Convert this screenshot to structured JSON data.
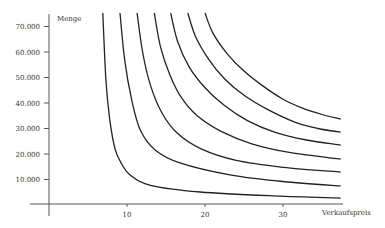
{
  "chart_data": {
    "type": "line",
    "title": "",
    "xlabel": "Verkaufspreis",
    "ylabel": "Menge",
    "xlim": [
      0,
      37.4
    ],
    "ylim": [
      0,
      75300
    ],
    "grid": false,
    "legend": null,
    "x_ticks": [
      10,
      20,
      30
    ],
    "x_tick_labels": [
      "10",
      "20",
      "30"
    ],
    "y_ticks": [
      10000,
      20000,
      30000,
      40000,
      50000,
      60000,
      70000
    ],
    "y_tick_labels": [
      "10.000",
      "20.000",
      "30.000",
      "40.000",
      "50.000",
      "60.000",
      "70.000"
    ],
    "series": [
      {
        "name": "Kurve 1",
        "points": [
          [
            6.9,
            75300
          ],
          [
            7.3,
            49000
          ],
          [
            7.8,
            33300
          ],
          [
            8.5,
            21600
          ],
          [
            9.4,
            15700
          ],
          [
            10.4,
            11800
          ],
          [
            12.9,
            7800
          ],
          [
            19.4,
            5100
          ],
          [
            29.6,
            3500
          ],
          [
            37.4,
            2700
          ]
        ]
      },
      {
        "name": "Kurve 2",
        "points": [
          [
            9.1,
            75300
          ],
          [
            9.7,
            56900
          ],
          [
            10.6,
            41200
          ],
          [
            11.7,
            29400
          ],
          [
            13.6,
            21600
          ],
          [
            16.8,
            16500
          ],
          [
            23.2,
            11800
          ],
          [
            30.0,
            9200
          ],
          [
            37.4,
            7500
          ]
        ]
      },
      {
        "name": "Kurve 3",
        "points": [
          [
            11.3,
            75300
          ],
          [
            12.0,
            60000
          ],
          [
            13.0,
            47000
          ],
          [
            14.5,
            36000
          ],
          [
            16.5,
            28000
          ],
          [
            19.5,
            22000
          ],
          [
            24.0,
            17500
          ],
          [
            30.0,
            14800
          ],
          [
            37.4,
            12900
          ]
        ]
      },
      {
        "name": "Kurve 4",
        "points": [
          [
            13.5,
            75300
          ],
          [
            14.3,
            62000
          ],
          [
            15.5,
            51000
          ],
          [
            17.0,
            42000
          ],
          [
            19.0,
            35000
          ],
          [
            22.0,
            29000
          ],
          [
            26.0,
            24000
          ],
          [
            31.0,
            20500
          ],
          [
            37.4,
            18000
          ]
        ]
      },
      {
        "name": "Kurve 5",
        "points": [
          [
            15.6,
            75300
          ],
          [
            16.5,
            64000
          ],
          [
            18.0,
            54000
          ],
          [
            20.0,
            46000
          ],
          [
            22.5,
            39000
          ],
          [
            25.5,
            33000
          ],
          [
            29.0,
            28500
          ],
          [
            33.0,
            25500
          ],
          [
            37.4,
            23500
          ]
        ]
      },
      {
        "name": "Kurve 6",
        "points": [
          [
            17.8,
            75300
          ],
          [
            18.8,
            66000
          ],
          [
            20.5,
            57000
          ],
          [
            22.5,
            49500
          ],
          [
            25.0,
            43000
          ],
          [
            28.0,
            37500
          ],
          [
            31.5,
            32500
          ],
          [
            34.5,
            30000
          ],
          [
            37.4,
            28600
          ]
        ]
      },
      {
        "name": "Kurve 7",
        "points": [
          [
            20.0,
            75300
          ],
          [
            21.0,
            67500
          ],
          [
            22.8,
            59500
          ],
          [
            25.0,
            52500
          ],
          [
            27.5,
            46500
          ],
          [
            30.0,
            41500
          ],
          [
            32.5,
            38000
          ],
          [
            35.0,
            35500
          ],
          [
            37.4,
            33700
          ]
        ]
      }
    ]
  },
  "axes": {
    "x_label": "Verkaufspreis",
    "y_label": "Menge"
  }
}
